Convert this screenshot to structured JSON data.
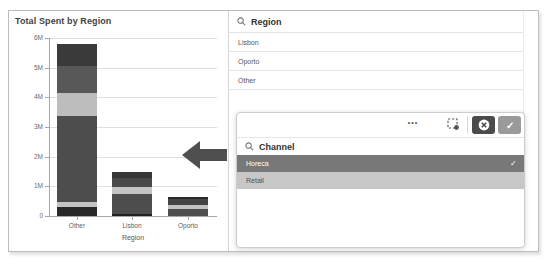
{
  "chart_data": {
    "type": "bar",
    "stacked": true,
    "title": "Total Spent by Region",
    "xlabel": "Region",
    "ylabel": "",
    "categories": [
      "Other",
      "Lisbon",
      "Oporto"
    ],
    "y_ticks": [
      "0",
      "1M",
      "2M",
      "3M",
      "4M",
      "5M",
      "6M"
    ],
    "ylim": [
      0,
      6000000
    ],
    "grid": true,
    "legend": "none",
    "totals": [
      5780000,
      1470000,
      630000
    ],
    "bars": [
      {
        "category": "Other",
        "segments": [
          {
            "from": 0,
            "to": 300000,
            "color": "#282828"
          },
          {
            "from": 300000,
            "to": 460000,
            "color": "#c3c3c3"
          },
          {
            "from": 460000,
            "to": 3370000,
            "color": "#4d4d4d"
          },
          {
            "from": 3370000,
            "to": 4150000,
            "color": "#bdbdbd"
          },
          {
            "from": 4150000,
            "to": 5050000,
            "color": "#585858"
          },
          {
            "from": 5050000,
            "to": 5780000,
            "color": "#3a3a3a"
          }
        ]
      },
      {
        "category": "Lisbon",
        "segments": [
          {
            "from": 0,
            "to": 60000,
            "color": "#1f1f1f"
          },
          {
            "from": 60000,
            "to": 740000,
            "color": "#4d4d4d"
          },
          {
            "from": 740000,
            "to": 970000,
            "color": "#c3c3c3"
          },
          {
            "from": 970000,
            "to": 1280000,
            "color": "#4a4a4a"
          },
          {
            "from": 1280000,
            "to": 1470000,
            "color": "#383838"
          }
        ]
      },
      {
        "category": "Oporto",
        "segments": [
          {
            "from": 0,
            "to": 220000,
            "color": "#4d4d4d"
          },
          {
            "from": 220000,
            "to": 380000,
            "color": "#c3c3c3"
          },
          {
            "from": 380000,
            "to": 580000,
            "color": "#454545"
          },
          {
            "from": 580000,
            "to": 630000,
            "color": "#2c2c2c"
          }
        ]
      }
    ]
  },
  "chart": {
    "title": "Total Spent by Region",
    "x_axis_title": "Region"
  },
  "region_pane": {
    "header": "Region",
    "items": [
      "Lisbon",
      "Oporto",
      "Other"
    ]
  },
  "channel_popup": {
    "header": "Channel",
    "items": [
      {
        "label": "Horeca",
        "state": "selected"
      },
      {
        "label": "Retail",
        "state": "alternative"
      }
    ],
    "toolbar": {
      "more_options_glyph": "•••",
      "selected_check_glyph": "✓",
      "confirm_glyph": "✓"
    }
  },
  "colors": {
    "selected_row_bg": "#787878",
    "selected_row_text": "#ffffff",
    "alternative_row_bg": "#c7c7c7",
    "alternative_row_text": "#4f4f4f",
    "cancel_button_bg": "#4b4b4b",
    "confirm_button_bg": "#9a9a9a",
    "annotation_arrow": "#4f4f4f",
    "frame_border": "#bdbdbd"
  }
}
